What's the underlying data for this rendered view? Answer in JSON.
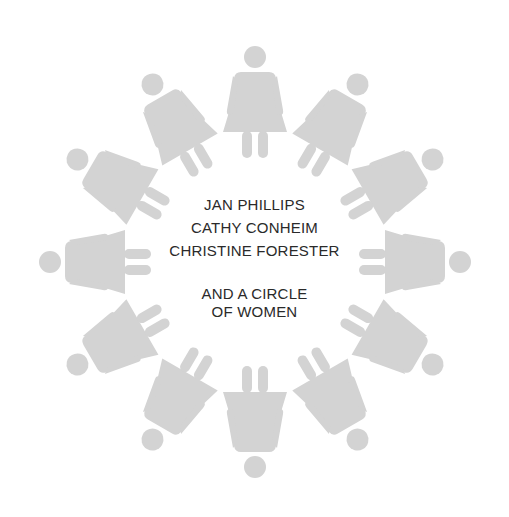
{
  "cover": {
    "authors": [
      "JAN PHILLIPS",
      "CATHY CONHEIM",
      "CHRISTINE FORESTER"
    ],
    "tagline_line1": "AND A CIRCLE",
    "tagline_line2": "OF WOMEN"
  },
  "illustration": {
    "figure_icon": "woman-figure-icon",
    "figure_count": 12,
    "figure_color": "#d3d3d3",
    "background_color": "#ffffff",
    "text_color": "#2a2a2a"
  }
}
